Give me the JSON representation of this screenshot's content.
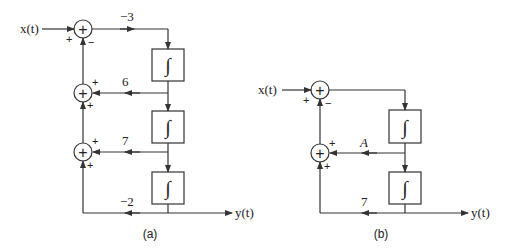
{
  "diagram_a": {
    "caption": "(a)",
    "input_label": "x(t)",
    "output_label": "y(t)",
    "gains": {
      "top": "−3",
      "first_feedback": "6",
      "second_feedback": "7",
      "bottom": "−2"
    },
    "sum1_signs": {
      "left": "+",
      "bottom": "−"
    },
    "sum2_signs": {
      "right": "+",
      "bottom": "+"
    },
    "sum3_signs": {
      "right": "+",
      "bottom": "+"
    },
    "sum_symbol": "+",
    "integrator_symbol": "∫"
  },
  "diagram_b": {
    "caption": "(b)",
    "input_label": "x(t)",
    "output_label": "y(t)",
    "gains": {
      "feedback": "A",
      "bottom": "7"
    },
    "sum1_signs": {
      "left": "+",
      "bottom": "−"
    },
    "sum2_signs": {
      "right": "+",
      "bottom": "+"
    },
    "sum_symbol": "+",
    "integrator_symbol": "∫"
  },
  "colors": {
    "line": "#333333",
    "text": "#222222",
    "background": "#ffffff"
  }
}
